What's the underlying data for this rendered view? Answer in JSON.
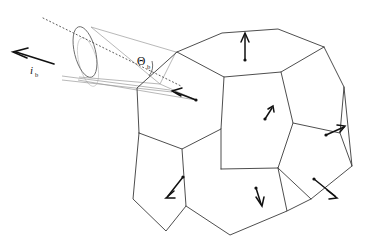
{
  "figure": {
    "background_color": "#ffffff",
    "width": 366,
    "height": 247
  },
  "labels": {
    "beam_symbol": "i",
    "beam_subscript": "b",
    "angle_symbol": "Θ",
    "angle_subscript": "b"
  },
  "colors": {
    "edge": "#3a3a3a",
    "cone": "#9a9a9a",
    "cone_faint": "#c2c2c2",
    "ellipse": "#6b6b6b",
    "axis": "#4a4a4a",
    "arrow": "#111111",
    "text": "#111111"
  },
  "geometry": {
    "polyhedron": {
      "name": "rhombic-dodecahedron-like-grain",
      "faces": [
        {
          "id": "top-face",
          "points": "177,52 222,33 278,29 324,47 281,72 224,77"
        },
        {
          "id": "upper-left-face",
          "points": "177,52 224,77 221,129 182,149 139,133 137,88"
        },
        {
          "id": "center-front-face",
          "points": "224,77 281,72 293,123 278,168 221,169 221,129"
        },
        {
          "id": "right-upper-face",
          "points": "281,72 324,47 344,87 340,133 293,123"
        },
        {
          "id": "lower-left-face",
          "points": "139,133 182,149 186,206 166,231 133,199"
        },
        {
          "id": "lower-center-face",
          "points": "182,149 221,169 278,168 287,211 230,235 186,206"
        },
        {
          "id": "lower-right-face",
          "points": "278,168 293,123 340,133 352,166 311,199 287,211"
        },
        {
          "id": "right-sliver-face",
          "points": "340,133 344,87 352,166"
        },
        {
          "id": "right-lower-sliver",
          "points": "340,133 352,166 311,199"
        }
      ],
      "edges": [
        "177,52 222,33 278,29 324,47",
        "177,52 224,77 281,72 324,47",
        "224,77 221,129 221,169",
        "281,72 293,123 278,168",
        "177,52 137,88 139,133",
        "139,133 182,149 221,129",
        "182,149 186,206 230,235",
        "139,133 133,199 166,231 186,206",
        "221,169 278,168 287,211 230,235",
        "293,123 340,133 352,166 311,199 287,211",
        "324,47 344,87 340,133",
        "344,87 352,166",
        "278,168 311,199"
      ]
    },
    "face_normals": [
      {
        "id": "normal-top-face",
        "tail": "245,61",
        "head": "245,33",
        "direction": "up"
      },
      {
        "id": "normal-upper-left-face",
        "tail": "195,99",
        "head": "172,91",
        "direction": "left"
      },
      {
        "id": "normal-center-front-face",
        "tail": "266,118",
        "head": "273,107",
        "direction": "up-right"
      },
      {
        "id": "normal-right-upper-face",
        "tail": "325,135",
        "head": "343,127",
        "direction": "up-right"
      },
      {
        "id": "normal-lower-left-face",
        "tail": "182,178",
        "head": "167,197",
        "direction": "down-left"
      },
      {
        "id": "normal-lower-center-face",
        "tail": "257,189",
        "head": "262,205",
        "direction": "down"
      },
      {
        "id": "normal-lower-right-face",
        "tail": "314,180",
        "head": "335,196",
        "direction": "down-right"
      }
    ],
    "beam_arrow": {
      "id": "incident-beam-vector",
      "tail": "52,63",
      "head": "14,52",
      "label_pos": "37,73"
    },
    "cone": {
      "id": "divergence-cone",
      "apex": "160,84",
      "base_center": "85,52",
      "base_rx": 10,
      "base_ry": 26,
      "base_rotation": -14,
      "faint_ellipse_center": "88,62",
      "faint_rx": 9,
      "faint_ry": 25
    },
    "axis": {
      "id": "optical-axis",
      "start": "43,18",
      "end": "178,84"
    },
    "angle_marker": {
      "id": "theta-angle-arc",
      "vertex": "160,84",
      "label_pos": "144,62"
    }
  }
}
